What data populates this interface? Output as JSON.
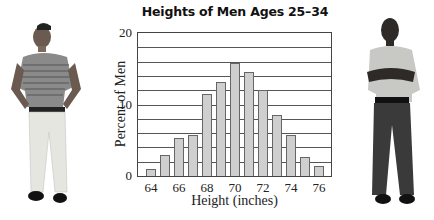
{
  "chart_data": {
    "type": "bar",
    "title": "Heights of Men Ages 25–34",
    "xlabel": "Height (inches)",
    "ylabel": "Percent of Men",
    "categories": [
      64,
      65,
      66,
      67,
      68,
      69,
      70,
      71,
      72,
      73,
      74,
      75,
      76
    ],
    "values": [
      1.0,
      3.0,
      5.3,
      5.8,
      11.5,
      13.1,
      15.8,
      14.5,
      12.1,
      8.6,
      5.7,
      2.7,
      1.4
    ],
    "x_tick_labels": [
      "64",
      "66",
      "68",
      "70",
      "72",
      "74",
      "76"
    ],
    "y_tick_labels": [
      "0",
      "10",
      "20"
    ],
    "ylim": [
      0,
      20
    ],
    "gridlines": [
      2,
      4,
      6,
      8,
      10,
      12,
      14,
      16,
      18
    ],
    "grid": true,
    "legend": null
  },
  "figure": {
    "title": "Heights of Men Ages 25–34",
    "xlabel": "Height (inches)",
    "ylabel": "Percent of Men",
    "bar_color": "#cfcfcf",
    "photos": [
      "man-in-striped-shirt-hands-on-hips",
      "man-with-arms-crossed"
    ]
  }
}
